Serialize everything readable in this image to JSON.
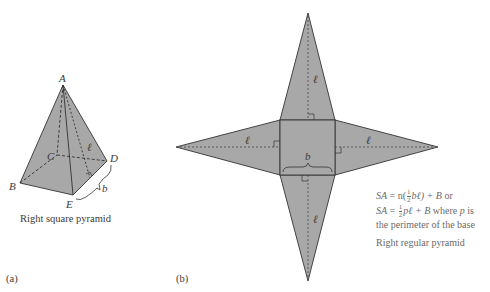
{
  "figure_a": {
    "panel_label": "(a)",
    "caption": "Right square pyramid",
    "vertex_labels": {
      "A": "A",
      "B": "B",
      "C": "C",
      "D": "D",
      "E": "E"
    },
    "slant_label": "ℓ",
    "base_label": "b",
    "fill_color": "#a8a8a8",
    "stroke_color": "#333333"
  },
  "figure_b": {
    "panel_label": "(b)",
    "caption": "Right regular pyramid",
    "slant_labels": [
      "ℓ",
      "ℓ",
      "ℓ",
      "ℓ"
    ],
    "base_label": "b",
    "formula": {
      "line1_prefix": "SA",
      "line1_eq": " = n(",
      "line1_frac_num": "1",
      "line1_frac_den": "2",
      "line1_tail": "bℓ) + B",
      "line1_or": " or",
      "line2_prefix": "SA",
      "line2_eq": " = ",
      "line2_frac_num": "1",
      "line2_frac_den": "2",
      "line2_tail": "pℓ + B",
      "line2_where": " where ",
      "line2_p": "p",
      "line2_is": " is",
      "line3": "the perimeter of the base"
    },
    "fill_color": "#a8a8a8",
    "stroke_color": "#333333"
  }
}
